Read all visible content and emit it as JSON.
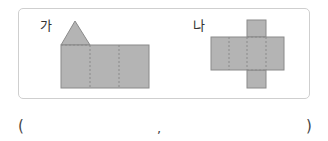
{
  "figures": [
    {
      "label": "가",
      "shape": "pentagonal-prism-net-like: triangle on rectangle split in 3"
    },
    {
      "label": "나",
      "shape": "cross-shaped net: 4 horizontal squares with top and bottom squares"
    }
  ],
  "answer": {
    "open": "(",
    "separator": ",",
    "close": ")"
  },
  "colors": {
    "fill": "#b4b4b4",
    "stroke": "#8a8a8a",
    "frame": "#cfcfcf"
  }
}
